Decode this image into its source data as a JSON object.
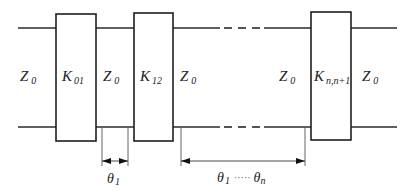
{
  "diagram": {
    "colors": {
      "stroke": "#2a2a2a",
      "text": "#222222",
      "background": "#ffffff"
    },
    "lines": {
      "top_y": 28,
      "bottom_y": 127,
      "left_start_x": 18,
      "right_end_x": 397
    },
    "inverters": [
      {
        "id": "k01",
        "label": "K",
        "subscript": "01",
        "x": 56,
        "y": 14,
        "w": 40,
        "h": 127
      },
      {
        "id": "k12",
        "label": "K",
        "subscript": "12",
        "x": 134,
        "y": 13,
        "w": 39,
        "h": 128
      },
      {
        "id": "knn1",
        "label": "K",
        "subscript": "n,n+1",
        "x": 311,
        "y": 12,
        "w": 40,
        "h": 128
      }
    ],
    "impedances": [
      {
        "id": "z0-input",
        "label": "Z",
        "subscript": "0",
        "x": 20,
        "y": 81
      },
      {
        "id": "z0-line1",
        "label": "Z",
        "subscript": "0",
        "x": 103,
        "y": 81
      },
      {
        "id": "z0-line2",
        "label": "Z",
        "subscript": "0",
        "x": 180,
        "y": 81
      },
      {
        "id": "z0-linen",
        "label": "Z",
        "subscript": "0",
        "x": 279,
        "y": 81
      },
      {
        "id": "z0-output",
        "label": "Z",
        "subscript": "0",
        "x": 362,
        "y": 81
      }
    ],
    "dashed_segments": [
      {
        "x1": 224,
        "x2": 232
      },
      {
        "x1": 238,
        "x2": 246
      },
      {
        "x1": 252,
        "x2": 260
      }
    ],
    "dimensions": [
      {
        "id": "theta1-dim",
        "x1": 102,
        "x2": 128,
        "ext_top": 128,
        "ext_bottom": 166,
        "arrow_y": 161,
        "label": "θ",
        "label_sub": "1",
        "label_x": 107,
        "label_y": 183
      },
      {
        "id": "theta1n-dim",
        "x1": 181,
        "x2": 305,
        "ext_top": 128,
        "ext_bottom": 166,
        "arrow_y": 161,
        "label": "θ",
        "label_sub": "1",
        "dots": "·····",
        "label2": "θ",
        "label2_sub": "n",
        "label_x": 217,
        "label_y": 182
      }
    ]
  }
}
